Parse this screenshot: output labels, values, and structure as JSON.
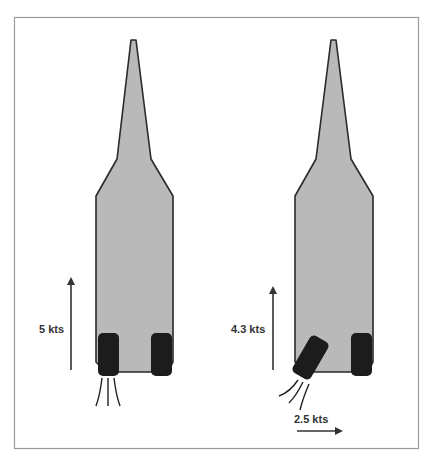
{
  "colors": {
    "hull_fill": "#b9b9b9",
    "hull_stroke": "#2a2a2a",
    "tire": "#1c1c1c",
    "arrow": "#333333",
    "frame": "#9a9a9a"
  },
  "left_boat": {
    "speed_forward": "5 kts"
  },
  "right_boat": {
    "speed_forward": "4.3 kts",
    "speed_lateral": "2.5 kts"
  }
}
